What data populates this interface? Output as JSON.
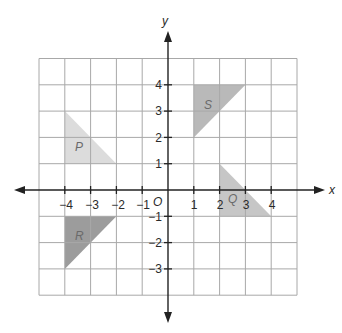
{
  "diagram": {
    "type": "coordinate-plane",
    "axes": {
      "x_label": "x",
      "y_label": "y",
      "origin_label": "O",
      "x_ticks": [
        "−4",
        "−3",
        "−2",
        "−1",
        "1",
        "2",
        "3",
        "4"
      ],
      "y_ticks": [
        "4",
        "3",
        "2",
        "1",
        "−1",
        "−2",
        "−3"
      ],
      "x_range": [
        -5,
        5
      ],
      "y_range": [
        -4,
        5
      ]
    },
    "shapes": [
      {
        "label": "P",
        "vertices": [
          [
            -4,
            3
          ],
          [
            -4,
            1
          ],
          [
            -2,
            1
          ]
        ],
        "fill": "#dcdcdc"
      },
      {
        "label": "S",
        "vertices": [
          [
            1,
            4
          ],
          [
            3,
            4
          ],
          [
            1,
            2
          ]
        ],
        "fill": "#b9b9b9"
      },
      {
        "label": "Q",
        "vertices": [
          [
            2,
            1
          ],
          [
            2,
            -1
          ],
          [
            4,
            -1
          ]
        ],
        "fill": "#c6c6c6"
      },
      {
        "label": "R",
        "vertices": [
          [
            -4,
            -1
          ],
          [
            -2,
            -1
          ],
          [
            -4,
            -3
          ]
        ],
        "fill": "#9c9c9c"
      }
    ]
  }
}
